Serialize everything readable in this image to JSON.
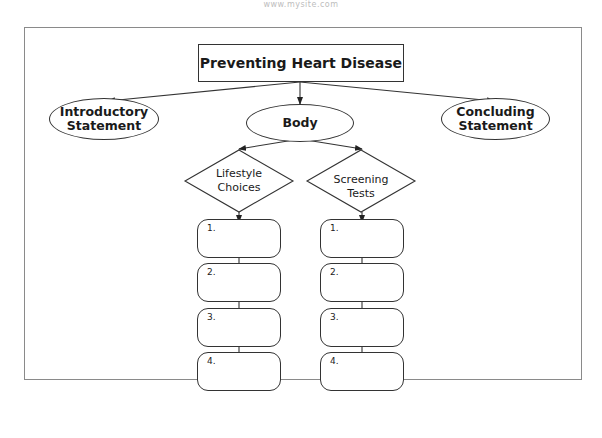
{
  "watermark": "www.mysite.com",
  "diagram": {
    "title": "Preventing Heart Disease",
    "level1": [
      {
        "id": "intro",
        "label_line1": "Introductory",
        "label_line2": "Statement"
      },
      {
        "id": "body",
        "label": "Body"
      },
      {
        "id": "conclusion",
        "label_line1": "Concluding",
        "label_line2": "Statement"
      }
    ],
    "branches": [
      {
        "label_line1": "Lifestyle",
        "label_line2": "Choices",
        "items": [
          "1.",
          "2.",
          "3.",
          "4."
        ]
      },
      {
        "label_line1": "Screening",
        "label_line2": "Tests",
        "items": [
          "1.",
          "2.",
          "3.",
          "4."
        ]
      }
    ]
  }
}
